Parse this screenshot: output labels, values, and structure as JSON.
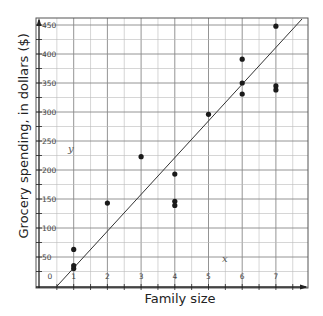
{
  "chart_data": {
    "type": "scatter",
    "title": "",
    "xlabel": "Family size",
    "ylabel": "Grocery spending, in dollars ($)",
    "axis_letters": {
      "x": "x",
      "y": "y"
    },
    "xlim": [
      0,
      7.8
    ],
    "ylim": [
      0,
      450
    ],
    "x_ticks": [
      0,
      1,
      2,
      3,
      4,
      5,
      6,
      7
    ],
    "y_ticks": [
      50,
      100,
      150,
      200,
      250,
      300,
      350,
      400,
      450
    ],
    "grid": true,
    "legend": null,
    "points": [
      {
        "x": 1,
        "y": 63
      },
      {
        "x": 1,
        "y": 35
      },
      {
        "x": 1,
        "y": 30
      },
      {
        "x": 2,
        "y": 143
      },
      {
        "x": 3,
        "y": 223
      },
      {
        "x": 4,
        "y": 193
      },
      {
        "x": 4,
        "y": 146
      },
      {
        "x": 4,
        "y": 139
      },
      {
        "x": 5,
        "y": 296
      },
      {
        "x": 6,
        "y": 391
      },
      {
        "x": 6,
        "y": 350
      },
      {
        "x": 6,
        "y": 331
      },
      {
        "x": 7,
        "y": 448
      },
      {
        "x": 7,
        "y": 345
      },
      {
        "x": 7,
        "y": 338
      }
    ],
    "line_of_best_fit": {
      "x1": 0.48,
      "y1": 0,
      "x2": 7.8,
      "y2": 460
    }
  }
}
